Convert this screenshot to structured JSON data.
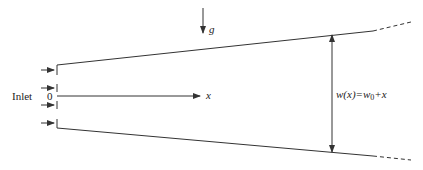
{
  "diagram": {
    "labels": {
      "inlet": "Inlet",
      "origin": "0",
      "x_axis": "x",
      "gravity": "g",
      "width_lhs": "w(x)=w",
      "width_sub": "0",
      "width_rhs": "+x"
    },
    "geometry": {
      "inlet_x": 57,
      "inlet_top_y": 65,
      "inlet_bottom_y": 128,
      "centerline_y": 96,
      "top_wall_solid_end": [
        373,
        31
      ],
      "top_wall_dashed_end": [
        411,
        22
      ],
      "bottom_wall_solid_end": [
        373,
        156
      ],
      "bottom_wall_dashed_end": [
        411,
        160
      ],
      "x_arrow_end": 200,
      "gravity_arrow_x": 203,
      "gravity_arrow_y": [
        8,
        33
      ],
      "width_arrow_x": 332,
      "width_arrow_y": [
        34,
        152
      ],
      "inlet_arrow_ys": [
        70,
        88,
        105,
        123
      ]
    },
    "colors": {
      "line": "#333333",
      "text": "#222222",
      "background": "#ffffff"
    }
  }
}
